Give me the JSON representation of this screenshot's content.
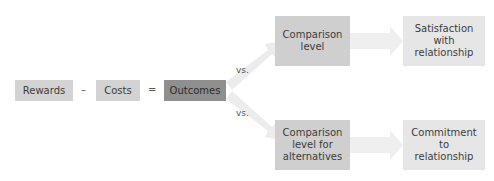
{
  "diagram": {
    "equation": {
      "rewards": "Rewards",
      "minus": "–",
      "costs": "Costs",
      "equals": "=",
      "outcomes": "Outcomes"
    },
    "vs_top": "vs.",
    "vs_bottom": "vs.",
    "top_branch": {
      "comparison": [
        "Comparison",
        "level"
      ],
      "result": [
        "Satisfaction",
        "with",
        "relationship"
      ]
    },
    "bottom_branch": {
      "comparison": [
        "Comparison",
        "level for",
        "alternatives"
      ],
      "result": [
        "Commitment",
        "to",
        "relationship"
      ]
    },
    "colors": {
      "light_box": "#d3d3d3",
      "outcomes_box": "#8f8f8f",
      "result_box": "#e6e6e6",
      "arrow": "#ececec"
    }
  }
}
